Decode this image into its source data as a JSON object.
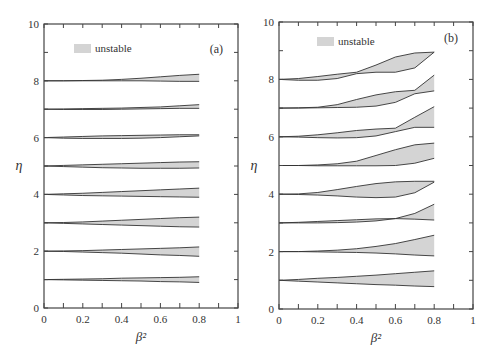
{
  "figure": {
    "background": "#ffffff",
    "fill_color": "#d4d4d4",
    "line_color": "#333333"
  },
  "chart_data": [
    {
      "type": "area",
      "panel_label": "(a)",
      "title": "",
      "xlabel": "β²",
      "ylabel": "η",
      "xlim": [
        0,
        1
      ],
      "ylim": [
        0,
        10
      ],
      "xticks": [
        0,
        0.2,
        0.4,
        0.6,
        0.8,
        1
      ],
      "xtick_labels": [
        "0",
        "0.2",
        "0.4",
        "0.6",
        "0.8",
        "1"
      ],
      "yticks": [
        0,
        2,
        4,
        6,
        8,
        10
      ],
      "ytick_labels": [
        "0",
        "2",
        "4",
        "6",
        "8",
        "10"
      ],
      "grid": false,
      "legend": {
        "label": "unstable",
        "position": "upper left"
      },
      "x": [
        0,
        0.1,
        0.2,
        0.3,
        0.4,
        0.5,
        0.6,
        0.7,
        0.8
      ],
      "series": [
        {
          "name": "n=1",
          "upper": [
            1.0,
            1.01,
            1.02,
            1.03,
            1.05,
            1.06,
            1.07,
            1.08,
            1.1
          ],
          "lower": [
            1.0,
            0.99,
            0.98,
            0.97,
            0.96,
            0.95,
            0.93,
            0.92,
            0.9
          ]
        },
        {
          "name": "n=2",
          "upper": [
            2.0,
            2.01,
            2.02,
            2.04,
            2.06,
            2.08,
            2.1,
            2.12,
            2.15
          ],
          "lower": [
            2.0,
            1.99,
            1.97,
            1.95,
            1.93,
            1.9,
            1.87,
            1.85,
            1.82
          ]
        },
        {
          "name": "n=3",
          "upper": [
            3.0,
            3.01,
            3.03,
            3.06,
            3.09,
            3.12,
            3.15,
            3.18,
            3.2
          ],
          "lower": [
            3.0,
            2.98,
            2.96,
            2.94,
            2.92,
            2.9,
            2.88,
            2.86,
            2.85
          ]
        },
        {
          "name": "n=4",
          "upper": [
            4.0,
            4.02,
            4.04,
            4.07,
            4.1,
            4.13,
            4.16,
            4.19,
            4.22
          ],
          "lower": [
            4.0,
            3.98,
            3.96,
            3.95,
            3.94,
            3.93,
            3.92,
            3.91,
            3.9
          ]
        },
        {
          "name": "n=5",
          "upper": [
            5.0,
            5.02,
            5.04,
            5.06,
            5.08,
            5.1,
            5.12,
            5.14,
            5.15
          ],
          "lower": [
            5.0,
            4.98,
            4.96,
            4.94,
            4.93,
            4.92,
            4.92,
            4.92,
            4.93
          ]
        },
        {
          "name": "n=6",
          "upper": [
            6.0,
            6.02,
            6.04,
            6.06,
            6.07,
            6.08,
            6.09,
            6.1,
            6.1
          ],
          "lower": [
            6.0,
            5.98,
            5.97,
            5.97,
            5.97,
            5.98,
            6.0,
            6.03,
            6.06
          ]
        },
        {
          "name": "n=7",
          "upper": [
            7.0,
            7.01,
            7.02,
            7.03,
            7.04,
            7.06,
            7.08,
            7.12,
            7.16
          ],
          "lower": [
            7.0,
            6.99,
            6.99,
            6.99,
            7.0,
            7.01,
            7.02,
            7.03,
            7.03
          ]
        },
        {
          "name": "n=8",
          "upper": [
            8.0,
            8.0,
            8.01,
            8.02,
            8.05,
            8.09,
            8.14,
            8.19,
            8.23
          ],
          "lower": [
            8.0,
            8.0,
            8.0,
            8.0,
            8.0,
            8.0,
            7.99,
            7.98,
            7.98
          ]
        }
      ]
    },
    {
      "type": "area",
      "panel_label": "(b)",
      "title": "",
      "xlabel": "β²",
      "ylabel": "η",
      "xlim": [
        0,
        1
      ],
      "ylim": [
        0,
        10
      ],
      "xticks": [
        0,
        0.2,
        0.4,
        0.6,
        0.8,
        1
      ],
      "xtick_labels": [
        "0",
        "0.2",
        "0.4",
        "0.6",
        "0.8",
        "1"
      ],
      "yticks": [
        0,
        2,
        4,
        6,
        8,
        10
      ],
      "ytick_labels": [
        "0",
        "2",
        "4",
        "6",
        "8",
        "10"
      ],
      "grid": false,
      "legend": {
        "label": "unstable",
        "position": "upper left"
      },
      "x": [
        0,
        0.1,
        0.2,
        0.3,
        0.4,
        0.5,
        0.6,
        0.7,
        0.8
      ],
      "series": [
        {
          "name": "n=1",
          "upper": [
            1.0,
            1.03,
            1.07,
            1.1,
            1.14,
            1.18,
            1.23,
            1.28,
            1.33
          ],
          "lower": [
            1.0,
            0.97,
            0.94,
            0.91,
            0.88,
            0.85,
            0.83,
            0.8,
            0.78
          ]
        },
        {
          "name": "n=2",
          "upper": [
            2.0,
            2.0,
            2.02,
            2.05,
            2.1,
            2.18,
            2.28,
            2.42,
            2.57
          ],
          "lower": [
            2.0,
            2.0,
            1.99,
            1.98,
            1.97,
            1.95,
            1.92,
            1.88,
            1.85
          ]
        },
        {
          "name": "n=3",
          "upper": [
            3.0,
            3.0,
            3.0,
            3.01,
            3.03,
            3.07,
            3.15,
            3.33,
            3.65
          ],
          "lower": [
            3.0,
            3.02,
            3.05,
            3.08,
            3.11,
            3.14,
            3.15,
            3.13,
            3.1
          ]
        },
        {
          "name": "n=4",
          "upper": [
            4.0,
            4.01,
            4.06,
            4.16,
            4.27,
            4.37,
            4.43,
            4.45,
            4.45
          ],
          "lower": [
            4.0,
            3.99,
            3.97,
            3.94,
            3.9,
            3.88,
            3.9,
            4.05,
            4.42
          ]
        },
        {
          "name": "n=5",
          "upper": [
            5.0,
            5.0,
            5.02,
            5.06,
            5.15,
            5.35,
            5.55,
            5.72,
            5.78
          ],
          "lower": [
            5.0,
            5.0,
            4.99,
            4.99,
            4.99,
            4.99,
            5.0,
            5.08,
            5.25
          ]
        },
        {
          "name": "n=6",
          "upper": [
            6.0,
            6.02,
            6.07,
            6.14,
            6.22,
            6.27,
            6.3,
            6.68,
            7.05
          ],
          "lower": [
            6.0,
            5.99,
            5.97,
            5.96,
            5.97,
            6.03,
            6.18,
            6.33,
            6.33
          ]
        },
        {
          "name": "n=7",
          "upper": [
            7.0,
            7.01,
            7.03,
            7.12,
            7.3,
            7.46,
            7.57,
            7.62,
            8.15
          ],
          "lower": [
            7.0,
            7.0,
            7.01,
            7.02,
            7.03,
            7.07,
            7.2,
            7.5,
            7.6
          ]
        },
        {
          "name": "n=8",
          "upper": [
            8.0,
            8.03,
            8.1,
            8.18,
            8.25,
            8.5,
            8.78,
            8.92,
            8.95
          ],
          "lower": [
            8.0,
            7.97,
            7.97,
            8.03,
            8.2,
            8.25,
            8.25,
            8.4,
            8.95
          ]
        }
      ]
    }
  ]
}
